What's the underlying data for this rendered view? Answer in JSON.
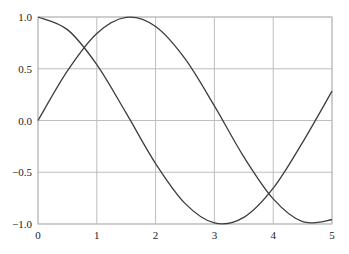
{
  "chart_data": {
    "type": "line",
    "title": "",
    "xlabel": "",
    "ylabel": "",
    "xlim": [
      0,
      5
    ],
    "ylim": [
      -1.0,
      1.0
    ],
    "grid": true,
    "legend": null,
    "x_ticks": [
      0,
      1,
      2,
      3,
      4,
      5
    ],
    "x_tick_labels": [
      "0",
      "1",
      "2",
      "3",
      "4",
      "5"
    ],
    "y_ticks": [
      1.0,
      0.5,
      0.0,
      -0.5,
      -1.0
    ],
    "y_tick_labels": [
      "1.0",
      "0.5",
      "0.0",
      "-0.5",
      "-1.0"
    ],
    "x": [
      0,
      0.5,
      1,
      1.5,
      2,
      2.5,
      3,
      3.5,
      4,
      4.5,
      5
    ],
    "series": [
      {
        "name": "sin(x)",
        "color": "#3d3d3d",
        "values": [
          0.0,
          0.479,
          0.841,
          0.997,
          0.909,
          0.598,
          0.141,
          -0.351,
          -0.757,
          -0.978,
          -0.959
        ]
      },
      {
        "name": "cos(x)",
        "color": "#3d3d3d",
        "values": [
          1.0,
          0.878,
          0.54,
          0.071,
          -0.416,
          -0.801,
          -0.99,
          -0.936,
          -0.654,
          -0.211,
          0.284
        ]
      }
    ]
  },
  "colors": {
    "line": "#3d3d3d",
    "grid": "#bdbdbd",
    "background": "#ffffff"
  }
}
